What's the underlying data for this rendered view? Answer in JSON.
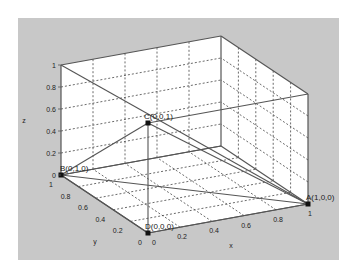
{
  "chart_data": {
    "type": "scatter3d",
    "title": "",
    "xlabel": "x",
    "ylabel": "y",
    "zlabel": "z",
    "xlim": [
      0,
      1
    ],
    "ylim": [
      0,
      1
    ],
    "zlim": [
      0,
      1
    ],
    "grid": true,
    "x_ticks": [
      "0",
      "0.2",
      "0.4",
      "0.6",
      "0.8",
      "1"
    ],
    "y_ticks": [
      "0",
      "0.2",
      "0.4",
      "0.6",
      "0.8",
      "1"
    ],
    "z_ticks": [
      "0",
      "0.2",
      "0.4",
      "0.6",
      "0.8",
      "1"
    ],
    "points": [
      {
        "label": "A(1,0,0)",
        "x": 1,
        "y": 0,
        "z": 0
      },
      {
        "label": "B(0,1,0)",
        "x": 0,
        "y": 1,
        "z": 0
      },
      {
        "label": "C(0,0,1)",
        "x": 0,
        "y": 0,
        "z": 1
      },
      {
        "label": "D(0,0,0)",
        "x": 0,
        "y": 0,
        "z": 0
      }
    ],
    "segments": [
      [
        "A",
        "B"
      ],
      [
        "A",
        "C"
      ],
      [
        "B",
        "C"
      ],
      [
        "C",
        "D"
      ],
      [
        "D",
        "A"
      ],
      [
        "D",
        "B"
      ]
    ],
    "extra_lines": [
      {
        "from": [
          0,
          1,
          1
        ],
        "to": [
          1,
          0,
          0
        ]
      },
      {
        "from": [
          1,
          1,
          0
        ],
        "to": [
          0,
          1,
          0
        ]
      }
    ]
  },
  "colors": {
    "panel_bg": "#c8c8c8",
    "axes_bg": "#ffffff",
    "line": "#555555",
    "grid": "#444444",
    "marker": "#111111"
  }
}
